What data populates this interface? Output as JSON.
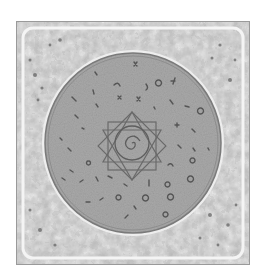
{
  "image": {
    "description": "Grayscale square tile with ornate mottled border framing a large circular seal filled with scattered glyph symbols and a central eight-pointed star enclosing a circle with a spiral",
    "colors": {
      "background": "#ffffff",
      "frame_outer": "#b8b8b8",
      "frame_inner_light": "#e6e6e6",
      "ornament_dark": "#6a6a6a",
      "circle_fill": "#a9a9a9",
      "circle_ring": "#7a7a7a",
      "glyph": "#5a5a5a",
      "star_line": "#6e6e6e"
    },
    "elements": {
      "frame": "ornate-square-frame",
      "seal": "circular-seal",
      "center_motif": "eight-pointed-star-with-spiral",
      "glyph_count_approx": 45
    }
  }
}
